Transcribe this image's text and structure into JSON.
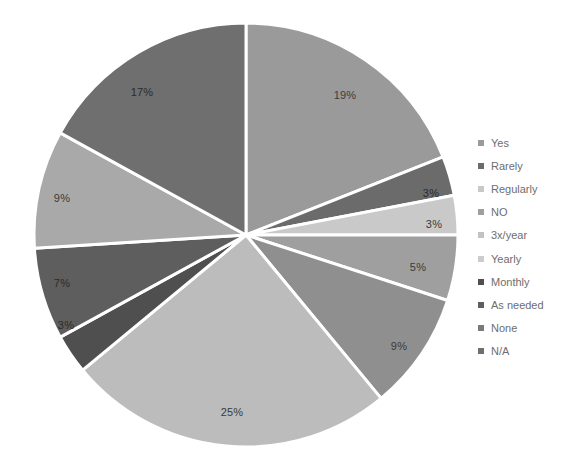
{
  "chart_data": {
    "type": "pie",
    "title": "",
    "xlabel": "",
    "ylabel": "",
    "categories": [
      "Yes",
      "Rarely",
      "Regularly",
      "NO",
      "3x/year",
      "Yearly",
      "Monthly",
      "As needed",
      "None",
      "N/A"
    ],
    "values": [
      19,
      3,
      3,
      5,
      9,
      25,
      3,
      7,
      9,
      17
    ],
    "value_labels": [
      "19%",
      "3%",
      "3%",
      "5%",
      "9%",
      "25%",
      "3%",
      "7%",
      "9%",
      "17%"
    ],
    "unit": "%",
    "start_angle_deg": 0,
    "direction": "clockwise",
    "legend_position": "right",
    "grid": false,
    "colors": [
      "#9a9a9a",
      "#6b6b6b",
      "#c9c9c9",
      "#9f9f9f",
      "#8f8f8f",
      "#bcbcbc",
      "#4f4f4f",
      "#5e5e5e",
      "#a9a9a9",
      "#6f6f6f"
    ],
    "slices": [
      {
        "label": "Yes",
        "value": 19,
        "value_label": "19%",
        "color": "#9a9a9a",
        "label_x": 345,
        "label_y": 95,
        "dark": false
      },
      {
        "label": "Rarely",
        "value": 3,
        "value_label": "3%",
        "color": "#6b6b6b",
        "label_x": 431,
        "label_y": 193,
        "dark": true
      },
      {
        "label": "Regularly",
        "value": 3,
        "value_label": "3%",
        "color": "#c9c9c9",
        "label_x": 434,
        "label_y": 224,
        "dark": false
      },
      {
        "label": "NO",
        "value": 5,
        "value_label": "5%",
        "color": "#9f9f9f",
        "label_x": 418,
        "label_y": 267,
        "dark": false
      },
      {
        "label": "3x/year",
        "value": 9,
        "value_label": "9%",
        "color": "#8f8f8f",
        "label_x": 399,
        "label_y": 346,
        "dark": false
      },
      {
        "label": "Yearly",
        "value": 25,
        "value_label": "25%",
        "color": "#bcbcbc",
        "label_x": 232,
        "label_y": 412,
        "dark": false
      },
      {
        "label": "Monthly",
        "value": 3,
        "value_label": "3%",
        "color": "#4f4f4f",
        "label_x": 66,
        "label_y": 325,
        "dark": true
      },
      {
        "label": "As needed",
        "value": 7,
        "value_label": "7%",
        "color": "#5e5e5e",
        "label_x": 62,
        "label_y": 283,
        "dark": true
      },
      {
        "label": "None",
        "value": 9,
        "value_label": "9%",
        "color": "#a9a9a9",
        "label_x": 62,
        "label_y": 198,
        "dark": false
      },
      {
        "label": "N/A",
        "value": 17,
        "value_label": "17%",
        "color": "#6f6f6f",
        "label_x": 142,
        "label_y": 92,
        "dark": true
      }
    ],
    "legend_entries": [
      {
        "label": "Yes",
        "color": "#9a9a9a"
      },
      {
        "label": "Rarely",
        "color": "#6b6b6b"
      },
      {
        "label": "Regularly",
        "color": "#c9c9c9"
      },
      {
        "label": "NO",
        "color": "#9f9f9f"
      },
      {
        "label": "3x/year",
        "color": "#c2c2c2"
      },
      {
        "label": "Yearly",
        "color": "#cccccc"
      },
      {
        "label": "Monthly",
        "color": "#4f4f4f"
      },
      {
        "label": "As needed",
        "color": "#5e5e5e"
      },
      {
        "label": "None",
        "color": "#7a7a7a"
      },
      {
        "label": "N/A",
        "color": "#6f6f6f"
      }
    ],
    "geometry": {
      "center_x": 246,
      "center_y": 235,
      "radius": 212,
      "separator_color": "#ffffff",
      "separator_width": 3
    }
  }
}
